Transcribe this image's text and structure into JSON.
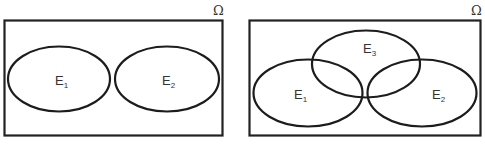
{
  "diagrams": [
    {
      "name": "disjoint-events",
      "universe_label": "Ω",
      "sets": [
        {
          "label": "E",
          "subscript": "1"
        },
        {
          "label": "E",
          "subscript": "2"
        }
      ]
    },
    {
      "name": "three-overlapping-events",
      "universe_label": "Ω",
      "sets": [
        {
          "label": "E",
          "subscript": "1"
        },
        {
          "label": "E",
          "subscript": "2"
        },
        {
          "label": "E",
          "subscript": "3"
        }
      ]
    }
  ],
  "colors": {
    "stroke": "#1c1c1c",
    "text": "#333333",
    "background": "#ffffff"
  }
}
